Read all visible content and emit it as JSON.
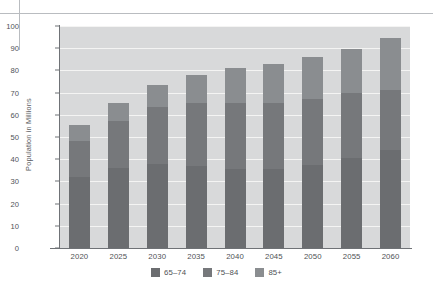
{
  "chart_data": {
    "type": "bar",
    "subtype": "stacked-bar",
    "title": "",
    "xlabel": "",
    "ylabel": "Population in Millions",
    "ylim": [
      0,
      100
    ],
    "ytick_step": 10,
    "yticks": [
      0,
      10,
      20,
      30,
      40,
      50,
      60,
      70,
      80,
      90,
      100
    ],
    "grid": true,
    "grid_axis": "y",
    "legend_position": "bottom",
    "categories": [
      "2020",
      "2025",
      "2030",
      "2035",
      "2040",
      "2045",
      "2050",
      "2055",
      "2060"
    ],
    "series": [
      {
        "name": "65–74",
        "color": "#6b6d70",
        "values": [
          32.0,
          36.0,
          38.0,
          37.0,
          35.5,
          35.5,
          37.5,
          40.5,
          44.0
        ]
      },
      {
        "name": "75–84",
        "color": "#76787b",
        "values": [
          16.0,
          21.0,
          25.5,
          28.5,
          30.0,
          30.0,
          29.5,
          29.5,
          27.0
        ]
      },
      {
        "name": "85+",
        "color": "#8a8d90",
        "values": [
          7.5,
          8.5,
          10.0,
          12.5,
          15.5,
          17.5,
          19.0,
          19.5,
          23.5
        ]
      }
    ],
    "totals": [
      55.5,
      65.5,
      73.5,
      78.0,
      81.0,
      83.0,
      86.0,
      89.5,
      94.5
    ],
    "plot_background": "#d8d9da",
    "gridline_color": "#f4f4f3",
    "axis_color": "#6f7276"
  },
  "legend": {
    "items": [
      {
        "label": "65–74",
        "color": "#6b6d70"
      },
      {
        "label": "75–84",
        "color": "#76787b"
      },
      {
        "label": "85+",
        "color": "#8a8d90"
      }
    ]
  }
}
